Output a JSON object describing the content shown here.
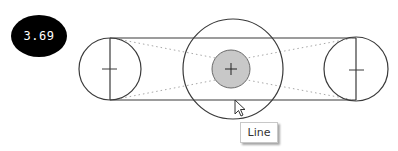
{
  "badge": {
    "value": "3.69"
  },
  "tooltip": {
    "label": "Line"
  },
  "colors": {
    "stroke": "#3a3a3a",
    "guide": "#b0b0b0",
    "selection_fill": "#c8c8c8",
    "badge_bg": "#000000",
    "badge_text": "#ffffff"
  },
  "geometry": {
    "left_circle": {
      "cx": 110,
      "cy": 69,
      "r": 31
    },
    "right_circle": {
      "cx": 356,
      "cy": 69,
      "r": 32
    },
    "center_circle": {
      "cx": 233,
      "cy": 69,
      "r": 50
    },
    "selected_point": {
      "cx": 231,
      "cy": 69,
      "r": 19
    },
    "top_line_y": 38,
    "bottom_line_y": 100
  }
}
